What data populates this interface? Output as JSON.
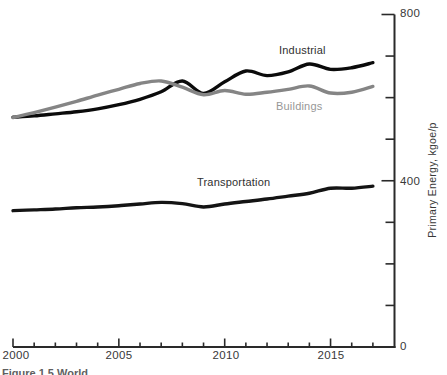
{
  "figure": {
    "type": "line-chart",
    "background": "#ffffff"
  },
  "axes": {
    "y": {
      "label": "Primary Energy, kgoe/p",
      "ticks": [
        "800",
        "400",
        "0"
      ]
    },
    "x": {
      "ticks": [
        "2000",
        "2005",
        "2010",
        "2015"
      ]
    }
  },
  "series_labels": {
    "industrial": "Industrial",
    "buildings": "Buildings",
    "transportation": "Transportation"
  },
  "caption": {
    "text": "Figure 1.5 World",
    "note": "caption clipped at bottom edge of image"
  },
  "colors": {
    "industrial": "#0b0b0b",
    "buildings": "#858585",
    "transportation": "#141414",
    "axis": "#2a2a2a",
    "text": "#383838",
    "label_dark": "#303030",
    "label_gray": "#979797"
  },
  "chart_data": {
    "type": "line",
    "title": "",
    "xlabel": "",
    "ylabel": "Primary Energy, kgoe/p",
    "xlim": [
      2000,
      2018
    ],
    "ylim": [
      0,
      800
    ],
    "x_major_ticks": [
      2000,
      2005,
      2010,
      2015
    ],
    "x_minor_step": 1,
    "y_major_ticks": [
      0,
      400,
      800
    ],
    "y_minor_step": 100,
    "grid": false,
    "legend": "inline-labels",
    "x": [
      2000,
      2001,
      2002,
      2003,
      2004,
      2005,
      2006,
      2007,
      2008,
      2009,
      2010,
      2011,
      2012,
      2013,
      2014,
      2015,
      2016,
      2017
    ],
    "series": [
      {
        "name": "Industrial",
        "color_key": "industrial",
        "values": [
          553,
          556,
          561,
          566,
          573,
          583,
          596,
          614,
          640,
          610,
          638,
          664,
          653,
          662,
          681,
          668,
          672,
          684
        ]
      },
      {
        "name": "Buildings",
        "color_key": "buildings",
        "values": [
          552,
          564,
          577,
          591,
          606,
          620,
          634,
          640,
          625,
          607,
          617,
          608,
          613,
          620,
          628,
          611,
          613,
          627
        ]
      },
      {
        "name": "Transportation",
        "color_key": "transportation",
        "values": [
          328,
          330,
          332,
          335,
          337,
          340,
          344,
          348,
          345,
          337,
          344,
          350,
          356,
          363,
          370,
          382,
          382,
          387
        ]
      }
    ]
  }
}
